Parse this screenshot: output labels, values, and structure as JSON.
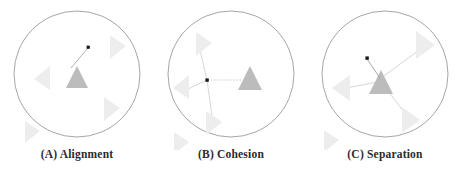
{
  "figure": {
    "background_color": "#ffffff",
    "width": 462,
    "height": 175
  },
  "style": {
    "circle_stroke": "#9b9b9b",
    "neighbor_boid_fill": "#ededed",
    "focal_boid_fill": "#bcbcbc",
    "vector_line_color": "#c9c9c9",
    "marker_dot_color": "#1a1a1a",
    "caption_color": "#2b2b2b"
  },
  "panels": [
    {
      "id": "alignment",
      "letter": "(A)",
      "name": "Alignment",
      "caption": "(A) Alignment",
      "circle": {
        "cx": 77,
        "cy": 74,
        "r": 63
      },
      "focal_boid": {
        "x": 77,
        "y": 78,
        "size": 17,
        "heading": "up",
        "fill": "#bcbcbc"
      },
      "neighbors": [
        {
          "x": 116,
          "y": 44,
          "size": 15,
          "heading": "right"
        },
        {
          "x": 44,
          "y": 78,
          "size": 15,
          "heading": "left"
        },
        {
          "x": 110,
          "y": 108,
          "size": 15,
          "heading": "right"
        },
        {
          "x": 31,
          "y": 131,
          "size": 14,
          "heading": "right"
        }
      ],
      "vectors": [
        {
          "type": "steering-arrow",
          "x1": 72,
          "y1": 67,
          "x2": 89,
          "y2": 48,
          "dot_at": "end"
        }
      ],
      "rule_description": "Steer towards the average heading of local flockmates"
    },
    {
      "id": "cohesion",
      "letter": "(B)",
      "name": "Cohesion",
      "caption": "(B) Cohesion",
      "circle": {
        "cx": 77,
        "cy": 74,
        "r": 63
      },
      "focal_boid": {
        "x": 96,
        "y": 80,
        "size": 17,
        "heading": "up",
        "fill": "#bcbcbc"
      },
      "neighbors": [
        {
          "x": 48,
          "y": 43,
          "size": 15,
          "heading": "right"
        },
        {
          "x": 29,
          "y": 88,
          "size": 15,
          "heading": "left"
        },
        {
          "x": 58,
          "y": 122,
          "size": 15,
          "heading": "right"
        },
        {
          "x": 26,
          "y": 142,
          "size": 14,
          "heading": "right"
        }
      ],
      "centroid_dot": {
        "x": 53,
        "y": 80
      },
      "vectors": [
        {
          "type": "centroid-link",
          "x1": 53,
          "y1": 80,
          "x2": 45,
          "y2": 46
        },
        {
          "type": "centroid-link",
          "x1": 53,
          "y1": 80,
          "x2": 33,
          "y2": 89
        },
        {
          "type": "centroid-link",
          "x1": 53,
          "y1": 80,
          "x2": 59,
          "y2": 124
        },
        {
          "type": "steering-arrow",
          "x1": 87,
          "y1": 80,
          "x2": 56,
          "y2": 80,
          "dot_at": "end"
        }
      ],
      "rule_description": "Steer to move towards the average position of local flockmates"
    },
    {
      "id": "separation",
      "letter": "(C)",
      "name": "Separation",
      "caption": "(C) Separation",
      "circle": {
        "cx": 77,
        "cy": 74,
        "r": 63
      },
      "focal_boid": {
        "x": 73,
        "y": 82,
        "size": 18,
        "heading": "up",
        "fill": "#bcbcbc"
      },
      "neighbors": [
        {
          "x": 116,
          "y": 45,
          "size": 17,
          "heading": "right"
        },
        {
          "x": 35,
          "y": 88,
          "size": 16,
          "heading": "left"
        },
        {
          "x": 101,
          "y": 120,
          "size": 16,
          "heading": "right"
        },
        {
          "x": 22,
          "y": 140,
          "size": 14,
          "heading": "right"
        }
      ],
      "vectors": [
        {
          "type": "repulsion-arrow",
          "x1": 73,
          "y1": 78,
          "x2": 116,
          "y2": 46
        },
        {
          "type": "repulsion-arrow",
          "x1": 70,
          "y1": 82,
          "x2": 36,
          "y2": 88
        },
        {
          "type": "repulsion-arrow",
          "x1": 76,
          "y1": 86,
          "x2": 101,
          "y2": 118
        },
        {
          "type": "steering-arrow",
          "x1": 72,
          "y1": 78,
          "x2": 58,
          "y2": 58,
          "dot_at": "end"
        }
      ],
      "rule_description": "Steer to avoid crowding local flockmates"
    }
  ]
}
